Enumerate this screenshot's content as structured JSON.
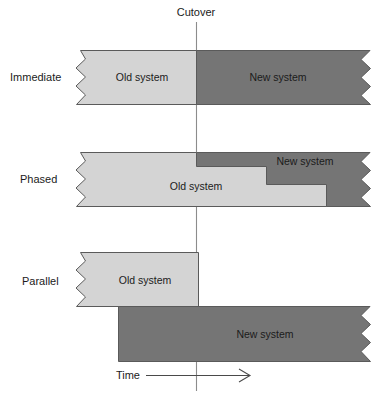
{
  "figure": {
    "cutover_label": "Cutover",
    "time_axis_label": "Time",
    "caption": ""
  },
  "colors": {
    "old_system_fill": "#d4d4d4",
    "new_system_fill": "#757575",
    "outline": "#5a5a5a",
    "cutover_line": "#8c8c8c",
    "background": "#ffffff",
    "text": "#1b1b1b"
  },
  "legend_terms": {
    "old_system": "Old system",
    "new_system": "New system"
  },
  "rows": [
    {
      "id": "immediate",
      "label": "Immediate",
      "segments": [
        {
          "name": "Old system",
          "phase": "old",
          "starts_at_cutover": false
        },
        {
          "name": "New system",
          "phase": "new",
          "starts_at_cutover": true
        }
      ]
    },
    {
      "id": "phased",
      "label": "Phased",
      "segments": [
        {
          "name": "Old system",
          "phase": "old",
          "starts_at_cutover": false
        },
        {
          "name": "New system",
          "phase": "new",
          "starts_at_cutover": true
        }
      ]
    },
    {
      "id": "parallel",
      "label": "Parallel",
      "segments": [
        {
          "name": "Old system",
          "phase": "old",
          "starts_at_cutover": false
        },
        {
          "name": "New system",
          "phase": "new",
          "starts_at_cutover": false
        }
      ]
    }
  ]
}
